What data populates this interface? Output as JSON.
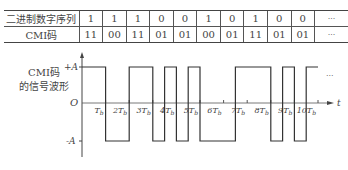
{
  "table": {
    "row1_header": "二进制数字序列",
    "row2_header": "CMI码",
    "binary": [
      "1",
      "1",
      "1",
      "0",
      "0",
      "1",
      "0",
      "1",
      "0",
      "0"
    ],
    "cmi": [
      "11",
      "00",
      "11",
      "01",
      "01",
      "00",
      "01",
      "11",
      "01",
      "01"
    ],
    "ellipsis": "···"
  },
  "waveform": {
    "label_line1": "CMI码",
    "label_line2": "的信号波形",
    "plus_label": "+A",
    "minus_label": "-A",
    "origin_label": "O",
    "t_label": "t",
    "ellipsis": "···",
    "tick_labels": [
      "T_b",
      "2T_b",
      "3T_b",
      "4T_b",
      "5T_b",
      "6T_b",
      "7T_b",
      "8T_b",
      "9T_b",
      "10T_b"
    ]
  },
  "chart_data": {
    "type": "line",
    "xlabel": "t",
    "ylabel": "",
    "x_unit": "T_b",
    "y_levels": {
      "high": "+A",
      "low": "-A"
    },
    "binary_sequence": [
      1,
      1,
      1,
      0,
      0,
      1,
      0,
      1,
      0,
      0
    ],
    "cmi_code": [
      "11",
      "00",
      "11",
      "01",
      "01",
      "00",
      "01",
      "11",
      "01",
      "01"
    ],
    "half_bit_levels": [
      1,
      1,
      -1,
      -1,
      1,
      1,
      -1,
      1,
      -1,
      1,
      -1,
      -1,
      -1,
      1,
      1,
      1,
      -1,
      1,
      -1,
      1
    ],
    "xlim": [
      0,
      10
    ],
    "ylim": [
      "-A",
      "+A"
    ]
  }
}
